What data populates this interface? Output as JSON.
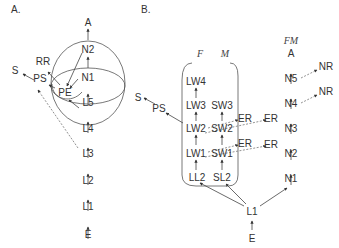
{
  "panels": {
    "a": {
      "label": "A.",
      "nodes": {
        "A": "A",
        "N2": "N2",
        "N1": "N1",
        "PE": "PE",
        "L5": "L5",
        "L4": "L4",
        "L3": "L3",
        "L2": "L2",
        "L1": "L1",
        "E": "E",
        "RR": "RR",
        "PS": "PS",
        "S": "S"
      }
    },
    "b": {
      "label": "B.",
      "group_labels": {
        "F": "F",
        "M": "M",
        "FM": "FM"
      },
      "nodes": {
        "LW4": "LW4",
        "LW3": "LW3",
        "SW3": "SW3",
        "LW2": "LW2",
        "SW2": "SW2",
        "LW1": "LW1",
        "SW1": "SW1",
        "LL2": "LL2",
        "SL2": "SL2",
        "ER1": "ER",
        "ER2": "ER",
        "ER3": "ER",
        "ER4": "ER",
        "PS": "PS",
        "S": "S",
        "A": "A",
        "N5": "N5",
        "N4": "N4",
        "N3": "N3",
        "N2": "N2",
        "N1": "N1",
        "NR1": "NR",
        "NR2": "NR",
        "L1": "L1",
        "E": "E"
      }
    }
  }
}
